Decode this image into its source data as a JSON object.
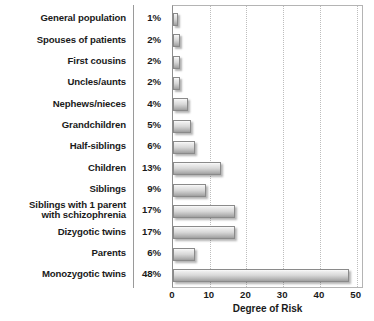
{
  "chart_data": {
    "type": "bar",
    "orientation": "horizontal",
    "title": "",
    "xlabel": "Degree of Risk",
    "ylabel": "",
    "xlim": [
      0,
      52
    ],
    "xticks": [
      0,
      10,
      20,
      30,
      40,
      50
    ],
    "xtick_labels": [
      "0",
      "10",
      "20",
      "30",
      "40",
      "50"
    ],
    "grid": "vertical-dotted",
    "legend": "none",
    "value_suffix": "%",
    "categories": [
      "General population",
      "Spouses of patients",
      "First cousins",
      "Uncles/aunts",
      "Nephews/nieces",
      "Grandchildren",
      "Half-siblings",
      "Children",
      "Siblings",
      "Siblings with 1 parent with schizophrenia",
      "Dizygotic twins",
      "Parents",
      "Monozygotic twins"
    ],
    "values": [
      1,
      2,
      2,
      2,
      4,
      5,
      6,
      13,
      9,
      17,
      17,
      6,
      48
    ],
    "value_labels": [
      "1%",
      "2%",
      "2%",
      "2%",
      "4%",
      "5%",
      "6%",
      "13%",
      "9%",
      "17%",
      "17%",
      "6%",
      "48%"
    ],
    "colors": {
      "bar_top": "#fbfbfb",
      "bar_bottom": "#9e9e9e",
      "bar_border": "#8a8a8a",
      "gridline": "#bdbdbd",
      "axis_border": "#b4b4b4",
      "text": "#1a1a1a",
      "divider": "#9a9a9a",
      "background": "#ffffff"
    }
  },
  "rows": [
    {
      "label": "General population",
      "label_line1": "General population",
      "label_line2": "",
      "pct": "1%"
    },
    {
      "label": "Spouses of patients",
      "label_line1": "Spouses of patients",
      "label_line2": "",
      "pct": "2%"
    },
    {
      "label": "First cousins",
      "label_line1": "First cousins",
      "label_line2": "",
      "pct": "2%"
    },
    {
      "label": "Uncles/aunts",
      "label_line1": "Uncles/aunts",
      "label_line2": "",
      "pct": "2%"
    },
    {
      "label": "Nephews/nieces",
      "label_line1": "Nephews/nieces",
      "label_line2": "",
      "pct": "4%"
    },
    {
      "label": "Grandchildren",
      "label_line1": "Grandchildren",
      "label_line2": "",
      "pct": "5%"
    },
    {
      "label": "Half-siblings",
      "label_line1": "Half-siblings",
      "label_line2": "",
      "pct": "6%"
    },
    {
      "label": "Children",
      "label_line1": "Children",
      "label_line2": "",
      "pct": "13%"
    },
    {
      "label": "Siblings",
      "label_line1": "Siblings",
      "label_line2": "",
      "pct": "9%"
    },
    {
      "label": "Siblings with 1 parent with schizophrenia",
      "label_line1": "Siblings with 1 parent",
      "label_line2": "with schizophrenia",
      "pct": "17%"
    },
    {
      "label": "Dizygotic twins",
      "label_line1": "Dizygotic twins",
      "label_line2": "",
      "pct": "17%"
    },
    {
      "label": "Parents",
      "label_line1": "Parents",
      "label_line2": "",
      "pct": "6%"
    },
    {
      "label": "Monozygotic twins",
      "label_line1": "Monozygotic twins",
      "label_line2": "",
      "pct": "48%"
    }
  ],
  "axis": {
    "title": "Degree of Risk",
    "ticks": [
      "0",
      "10",
      "20",
      "30",
      "40",
      "50"
    ]
  }
}
